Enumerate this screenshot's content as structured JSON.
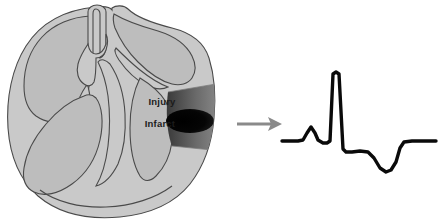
{
  "diagram": {
    "heart": {
      "name": "heart-cross-section",
      "labels": [
        {
          "id": "injury",
          "text": "Injury",
          "x": 162,
          "y": 105
        },
        {
          "id": "infarct",
          "text": "Infarct",
          "x": 160,
          "y": 127
        }
      ],
      "zones": [
        {
          "id": "injury-zone",
          "label": "Injury",
          "color": "#5e5e5e"
        },
        {
          "id": "infarct-core",
          "label": "Infarct",
          "color": "#0d0d0d"
        }
      ]
    },
    "arrow": {
      "name": "flow-arrow",
      "direction": "right",
      "color": "#8a8a8a",
      "x1": 237,
      "y1": 124,
      "x2": 281,
      "y2": 124
    },
    "ecg": {
      "name": "ecg-tracing",
      "color": "#0a0a0a",
      "stroke_width": 3.4,
      "description": "ST-elevation myocardial infarction tracing: P wave, tall R wave, elevated ST segment, inverted T wave"
    }
  },
  "colors": {
    "myocardium": "#c9c9c9",
    "chamber": "#bdbdbd",
    "outline": "#4a4a4a",
    "injury": "#5e5e5e",
    "infarct": "#0d0d0d",
    "arrow": "#8a8a8a",
    "trace": "#0a0a0a",
    "background": "#ffffff"
  },
  "chart_data": {
    "type": "line",
    "xlabel": "",
    "ylabel": "",
    "series": [
      {
        "name": "ECG",
        "points": [
          [
            282,
            141
          ],
          [
            298,
            141
          ],
          [
            303,
            140
          ],
          [
            307,
            133
          ],
          [
            311,
            127
          ],
          [
            315,
            133
          ],
          [
            318,
            140
          ],
          [
            323,
            143
          ],
          [
            327,
            143
          ],
          [
            330,
            141
          ],
          [
            333,
            74
          ],
          [
            336,
            72
          ],
          [
            339,
            74
          ],
          [
            343,
            149
          ],
          [
            346,
            152
          ],
          [
            352,
            152
          ],
          [
            360,
            151
          ],
          [
            368,
            152
          ],
          [
            374,
            158
          ],
          [
            380,
            168
          ],
          [
            386,
            172
          ],
          [
            391,
            170
          ],
          [
            396,
            162
          ],
          [
            400,
            148
          ],
          [
            404,
            142
          ],
          [
            412,
            141
          ],
          [
            436,
            141
          ]
        ]
      }
    ],
    "annotations": [
      {
        "label": "P wave",
        "x": 311,
        "y": 127
      },
      {
        "label": "R wave",
        "x": 336,
        "y": 72
      },
      {
        "label": "ST elevation",
        "x": 360,
        "y": 151
      },
      {
        "label": "Inverted T wave",
        "x": 386,
        "y": 172
      }
    ],
    "grid": false,
    "legend": false
  }
}
